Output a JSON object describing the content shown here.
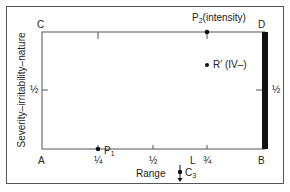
{
  "diagram": {
    "corners": {
      "A": "A",
      "B": "B",
      "C": "C",
      "D": "D"
    },
    "x_axis": {
      "label": "Range",
      "ticks": [
        "¼",
        "½",
        "¾"
      ],
      "marker_L": "L"
    },
    "y_axis": {
      "label": "Severity–irritability–nature",
      "left_tick": "½",
      "right_tick": "½"
    },
    "points": {
      "P1": {
        "label": "P",
        "sub": "1",
        "x": 0.25,
        "y": 0
      },
      "P2": {
        "label": "P",
        "sub": "2",
        "suffix": "(intensity)",
        "x": 0.75,
        "y": 1
      },
      "R_prime": {
        "label": "R′ (IV–)",
        "x": 0.75,
        "y": 0.72
      }
    },
    "C3": {
      "label": "C",
      "sub": "3"
    },
    "colors": {
      "line": "#555555",
      "bar": "#111111",
      "text": "#222222"
    }
  }
}
